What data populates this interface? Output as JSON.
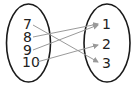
{
  "diagram": {
    "type": "mapping",
    "domain": [
      "7",
      "8",
      "9",
      "10"
    ],
    "range": [
      "1",
      "2",
      "3"
    ],
    "mappings": [
      {
        "from": "7",
        "to": "3"
      },
      {
        "from": "8",
        "to": "1"
      },
      {
        "from": "9",
        "to": "1"
      },
      {
        "from": "10",
        "to": "2"
      }
    ],
    "colors": {
      "oval": "#1a1a1a",
      "arrow": "#9a9a9a",
      "text": "#222222"
    }
  }
}
